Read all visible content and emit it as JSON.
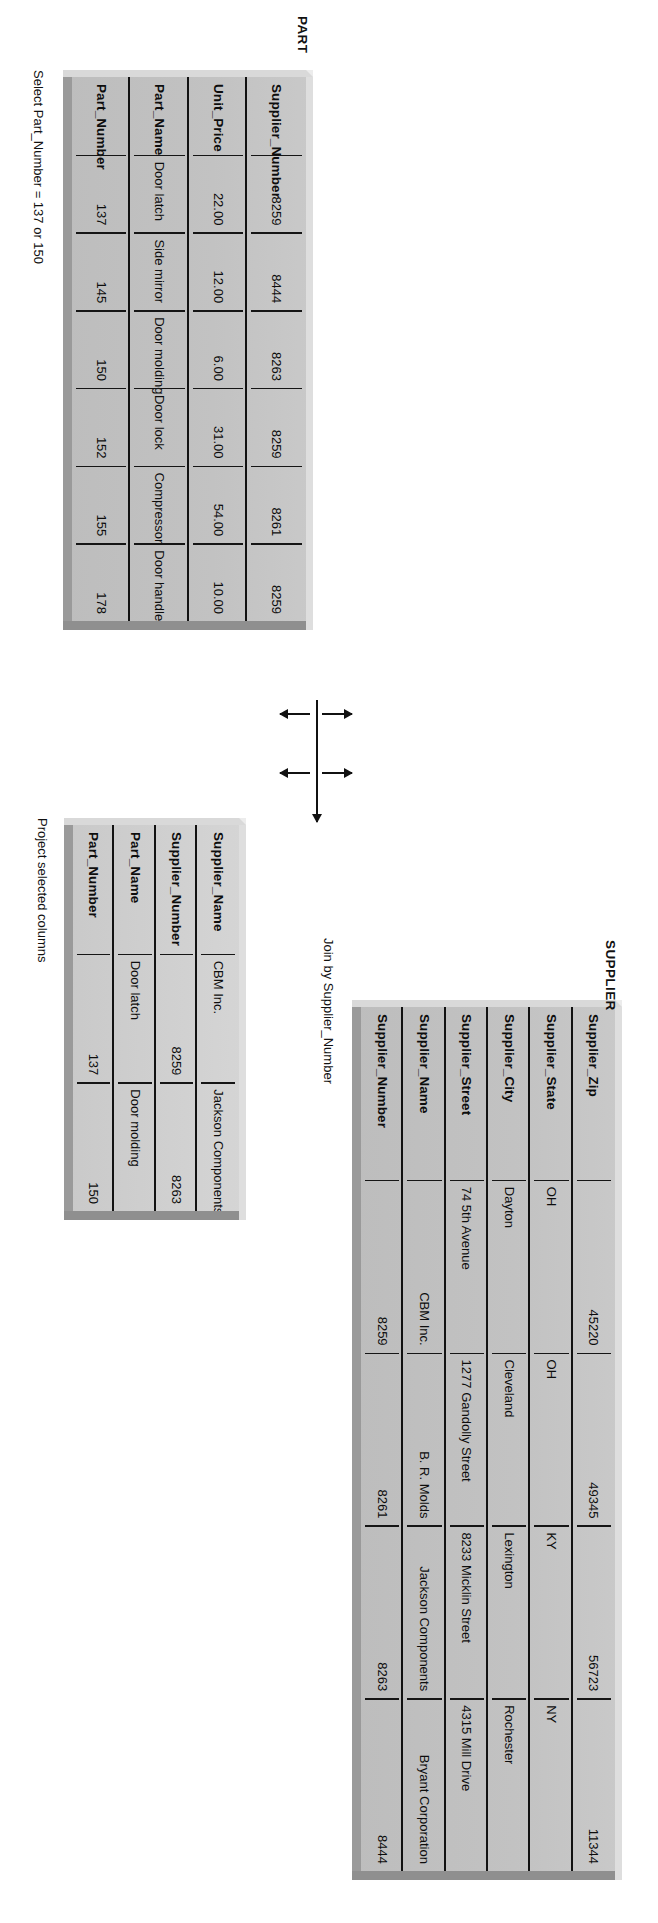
{
  "diagram": {
    "title_part": "PART",
    "title_supplier": "SUPPLIER",
    "annotation_select": "Select Part_Number = 137 or 150",
    "annotation_join": "Join by Supplier_Number",
    "annotation_project": "Project selected columns"
  },
  "part_table": {
    "name": "PART",
    "columns": [
      {
        "header": "Part_Number",
        "values": [
          "137",
          "145",
          "150",
          "152",
          "155",
          "178"
        ],
        "align": "right"
      },
      {
        "header": "Part_Name",
        "values": [
          "Door latch",
          "Side mirror",
          "Door molding",
          "Door lock",
          "Compressor",
          "Door handle"
        ],
        "align": "left"
      },
      {
        "header": "Unit_Price",
        "values": [
          "22.00",
          "12.00",
          "6.00",
          "31.00",
          "54.00",
          "10.00"
        ],
        "align": "right"
      },
      {
        "header": "Supplier_Number",
        "values": [
          "8259",
          "8444",
          "8263",
          "8259",
          "8261",
          "8259"
        ],
        "align": "right"
      }
    ]
  },
  "supplier_table": {
    "name": "SUPPLIER",
    "columns": [
      {
        "header": "Supplier_Number",
        "values": [
          "8259",
          "8261",
          "8263",
          "8444"
        ],
        "align": "right"
      },
      {
        "header": "Supplier_Name",
        "values": [
          "CBM Inc.",
          "B. R. Molds",
          "Jackson Components",
          "Bryant Corporation"
        ],
        "align": "right"
      },
      {
        "header": "Supplier_Street",
        "values": [
          "74 5th Avenue",
          "1277 Gandolly Street",
          "8233 Micklin Street",
          "4315 Mill Drive"
        ],
        "align": "left"
      },
      {
        "header": "Supplier_City",
        "values": [
          "Dayton",
          "Cleveland",
          "Lexington",
          "Rochester"
        ],
        "align": "left"
      },
      {
        "header": "Supplier_State",
        "values": [
          "OH",
          "OH",
          "KY",
          "NY"
        ],
        "align": "left"
      },
      {
        "header": "Supplier_Zip",
        "values": [
          "45220",
          "49345",
          "56723",
          "11344"
        ],
        "align": "right"
      }
    ]
  },
  "result_table": {
    "name": "Result",
    "columns": [
      {
        "header": "Part_Number",
        "values": [
          "137",
          "150"
        ],
        "align": "right"
      },
      {
        "header": "Part_Name",
        "values": [
          "Door latch",
          "Door molding"
        ],
        "align": "left"
      },
      {
        "header": "Supplier_Number",
        "values": [
          "8259",
          "8263"
        ],
        "align": "right"
      },
      {
        "header": "Supplier_Name",
        "values": [
          "CBM Inc.",
          "Jackson Components"
        ],
        "align": "left"
      }
    ]
  },
  "colors": {
    "table_face": "#c4c4c4",
    "table_face_light": "#cfcfcf",
    "bevel_light": "#dedede",
    "bevel_shadow": "#909090",
    "ink": "#111111",
    "background": "#ffffff"
  }
}
